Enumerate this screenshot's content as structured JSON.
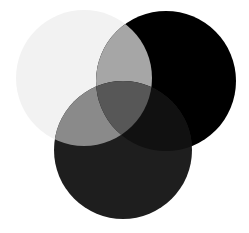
{
  "diagram": {
    "type": "venn-three-circles",
    "background": "#ffffff",
    "circles": [
      {
        "id": "light",
        "cx": 84,
        "cy": 78,
        "r": 68,
        "fill": "#f2f2f2"
      },
      {
        "id": "black",
        "cx": 166,
        "cy": 81,
        "r": 70,
        "fill": "#000000"
      },
      {
        "id": "dark",
        "cx": 123,
        "cy": 150,
        "r": 69,
        "fill": "#1e1e1e"
      }
    ],
    "overlaps": {
      "light_black": "#a6a6a6",
      "light_dark": "#8a8a8a",
      "black_dark": "#111111",
      "all_three": "#575757"
    }
  }
}
